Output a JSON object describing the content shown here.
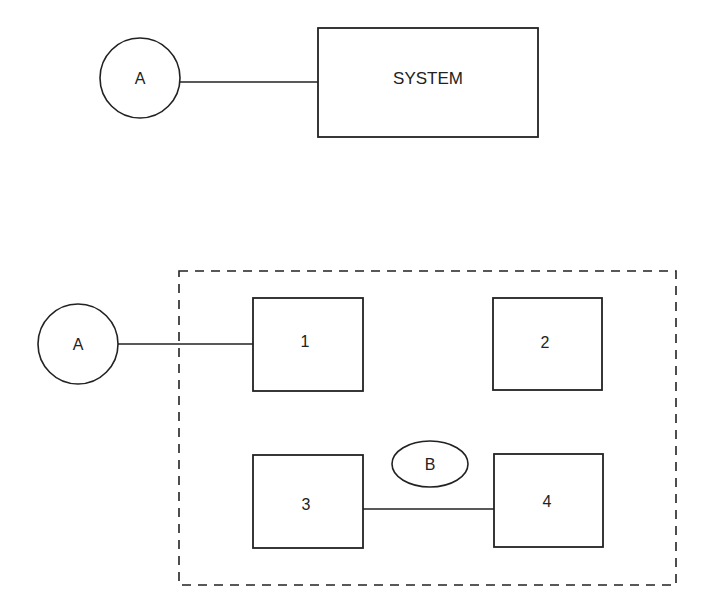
{
  "top_diagram": {
    "external_entity": {
      "label": "A"
    },
    "system_box": {
      "label": "SYSTEM"
    }
  },
  "bottom_diagram": {
    "external_entity": {
      "label": "A"
    },
    "subsystems": [
      {
        "label": "1"
      },
      {
        "label": "2"
      },
      {
        "label": "3"
      },
      {
        "label": "4"
      }
    ],
    "interface": {
      "label": "B"
    }
  },
  "colors": {
    "stroke": "#222222",
    "background": "#ffffff"
  }
}
